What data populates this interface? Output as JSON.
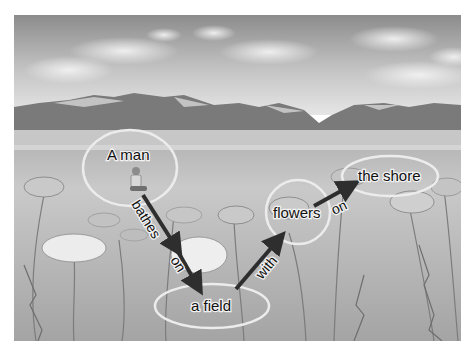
{
  "scene_graph": {
    "nodes": [
      {
        "id": "man",
        "label": "A man",
        "cx": 130,
        "cy": 168,
        "rx": 47,
        "ry": 38
      },
      {
        "id": "field",
        "label": "a field",
        "cx": 212,
        "cy": 306,
        "rx": 57,
        "ry": 22
      },
      {
        "id": "flowers",
        "label": "flowers",
        "cx": 298,
        "cy": 212,
        "rx": 32,
        "ry": 32
      },
      {
        "id": "shore",
        "label": "the shore",
        "cx": 390,
        "cy": 176,
        "rx": 48,
        "ry": 20
      }
    ],
    "edges": [
      {
        "from": "man",
        "to": "field",
        "label_1": "bathes",
        "label_2": "on"
      },
      {
        "from": "field",
        "to": "flowers",
        "label": "with"
      },
      {
        "from": "flowers",
        "to": "shore",
        "label": "on"
      }
    ]
  },
  "colors": {
    "ellipse_stroke": "#e8e8e8",
    "arrow": "#2e2e2e",
    "sky_top": "#8a8a8a",
    "sky_bottom": "#e4e4e4",
    "mountain": "#7d7d7d",
    "field": "#a8a8a8"
  }
}
